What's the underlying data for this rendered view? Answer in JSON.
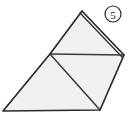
{
  "figure": {
    "label": {
      "text": "5",
      "style": "circled-number",
      "center_x": 113,
      "center_y": 14,
      "radius": 8
    },
    "colors": {
      "background": "#ffffff",
      "fill": "#f0f0ef",
      "outline": "#2b2b2b",
      "inner_line": "#3a3a3a",
      "label_ink": "#222222"
    },
    "geometry": {
      "type": "polygon-with-internal-divisions",
      "outline_points": "82,11 124,55 100,110 3,111 50,54",
      "vertices": [
        {
          "name": "apex",
          "x": 82,
          "y": 11
        },
        {
          "name": "right",
          "x": 124,
          "y": 55
        },
        {
          "name": "bottom-right",
          "x": 100,
          "y": 110
        },
        {
          "name": "bottom-left",
          "x": 3,
          "y": 111
        },
        {
          "name": "mid-left",
          "x": 50,
          "y": 54
        }
      ],
      "internal_lines": [
        {
          "name": "horizontal-divider",
          "x1": 50,
          "y1": 54,
          "x2": 124,
          "y2": 55
        },
        {
          "name": "diagonal-divider",
          "x1": 50,
          "y1": 54,
          "x2": 100,
          "y2": 110
        }
      ],
      "doubled_edge": {
        "name": "upper-right-edge",
        "x1": 82,
        "y1": 11,
        "x2": 124,
        "y2": 55
      },
      "regions": [
        {
          "name": "upper-triangle",
          "points": "82,11 124,55 50,54"
        },
        {
          "name": "right-triangle",
          "points": "50,54 124,55 100,110"
        },
        {
          "name": "lower-left-triangle",
          "points": "50,54 100,110 3,111"
        }
      ]
    }
  }
}
